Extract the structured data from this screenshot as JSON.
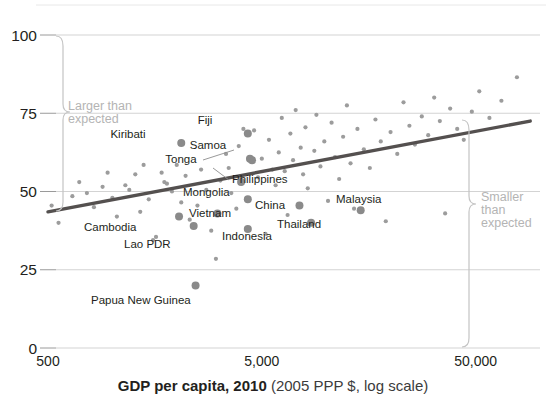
{
  "chart_data": {
    "type": "scatter",
    "title": "",
    "xlabel_bold": "GDP per capita, 2010",
    "xlabel_light": " (2005 PPP $, log scale)",
    "ylabel": "",
    "xscale": "log",
    "xlim": [
      500,
      100000
    ],
    "ylim": [
      0,
      100
    ],
    "grid": true,
    "legend": "none",
    "xticks": [
      {
        "value": 500,
        "label": "500"
      },
      {
        "value": 5000,
        "label": "5,000"
      },
      {
        "value": 50000,
        "label": "50,000"
      }
    ],
    "yticks": [
      {
        "value": 0,
        "label": "0"
      },
      {
        "value": 25,
        "label": "25"
      },
      {
        "value": 50,
        "label": "50"
      },
      {
        "value": 75,
        "label": "75"
      },
      {
        "value": 100,
        "label": "100"
      }
    ],
    "trendline": {
      "x": [
        500,
        90000
      ],
      "y": [
        43.5,
        72.5
      ],
      "color": "#54504f"
    },
    "annotations": [
      {
        "id": "larger-than-expected",
        "text_line1": "Larger than",
        "text_line2": "expected",
        "color": "#b4b4b4"
      },
      {
        "id": "smaller-than-expected",
        "text_line1": "Smaller",
        "text_line2": "than",
        "text_line3": "expected",
        "color": "#b4b4b4"
      }
    ],
    "labeled_points": [
      {
        "name": "Fiji",
        "x": 4300,
        "y": 68.5
      },
      {
        "name": "Kiribati",
        "x": 2100,
        "y": 65.5
      },
      {
        "name": "Samoa",
        "x": 4400,
        "y": 60.5
      },
      {
        "name": "Tonga",
        "x": 4500,
        "y": 60.0
      },
      {
        "name": "Philippines",
        "x": 4000,
        "y": 53.0
      },
      {
        "name": "Mongolia",
        "x": 4300,
        "y": 47.5
      },
      {
        "name": "China",
        "x": 7500,
        "y": 45.5
      },
      {
        "name": "Malaysia",
        "x": 14500,
        "y": 44.0
      },
      {
        "name": "Vietnam",
        "x": 3100,
        "y": 43.0
      },
      {
        "name": "Thailand",
        "x": 8500,
        "y": 40.0
      },
      {
        "name": "Cambodia",
        "x": 2050,
        "y": 42.0
      },
      {
        "name": "Indonesia",
        "x": 4300,
        "y": 38.0
      },
      {
        "name": "Lao PDR",
        "x": 2400,
        "y": 39.0
      },
      {
        "name": "Papua New Guinea",
        "x": 2450,
        "y": 20.0
      }
    ],
    "unlabeled_points": [
      {
        "x": 520,
        "y": 45.5
      },
      {
        "x": 560,
        "y": 40.0
      },
      {
        "x": 650,
        "y": 48.5
      },
      {
        "x": 700,
        "y": 53.0
      },
      {
        "x": 760,
        "y": 49.5
      },
      {
        "x": 820,
        "y": 45.0
      },
      {
        "x": 900,
        "y": 51.5
      },
      {
        "x": 950,
        "y": 56.0
      },
      {
        "x": 1000,
        "y": 48.0
      },
      {
        "x": 1050,
        "y": 42.0
      },
      {
        "x": 1150,
        "y": 52.0
      },
      {
        "x": 1200,
        "y": 50.5
      },
      {
        "x": 1280,
        "y": 55.5
      },
      {
        "x": 1350,
        "y": 43.5
      },
      {
        "x": 1400,
        "y": 58.5
      },
      {
        "x": 1480,
        "y": 47.5
      },
      {
        "x": 1550,
        "y": 34.5
      },
      {
        "x": 1600,
        "y": 35.5
      },
      {
        "x": 1700,
        "y": 56.0
      },
      {
        "x": 1750,
        "y": 53.0
      },
      {
        "x": 1800,
        "y": 52.5
      },
      {
        "x": 1900,
        "y": 50.0
      },
      {
        "x": 2000,
        "y": 58.5
      },
      {
        "x": 2100,
        "y": 46.5
      },
      {
        "x": 2200,
        "y": 55.0
      },
      {
        "x": 2300,
        "y": 41.0
      },
      {
        "x": 2500,
        "y": 45.5
      },
      {
        "x": 2600,
        "y": 57.0
      },
      {
        "x": 2750,
        "y": 50.5
      },
      {
        "x": 2900,
        "y": 37.5
      },
      {
        "x": 3050,
        "y": 28.5
      },
      {
        "x": 3200,
        "y": 53.5
      },
      {
        "x": 3400,
        "y": 62.0
      },
      {
        "x": 3500,
        "y": 57.5
      },
      {
        "x": 3600,
        "y": 49.5
      },
      {
        "x": 3800,
        "y": 44.5
      },
      {
        "x": 3900,
        "y": 64.5
      },
      {
        "x": 4100,
        "y": 70.0
      },
      {
        "x": 4600,
        "y": 69.5
      },
      {
        "x": 4800,
        "y": 54.5
      },
      {
        "x": 5000,
        "y": 60.5
      },
      {
        "x": 5200,
        "y": 36.5
      },
      {
        "x": 5400,
        "y": 66.5
      },
      {
        "x": 5600,
        "y": 57.0
      },
      {
        "x": 5800,
        "y": 52.0
      },
      {
        "x": 6000,
        "y": 62.5
      },
      {
        "x": 6200,
        "y": 73.5
      },
      {
        "x": 6400,
        "y": 56.5
      },
      {
        "x": 6600,
        "y": 42.5
      },
      {
        "x": 6800,
        "y": 68.5
      },
      {
        "x": 7000,
        "y": 60.0
      },
      {
        "x": 7200,
        "y": 76.0
      },
      {
        "x": 7600,
        "y": 64.0
      },
      {
        "x": 7800,
        "y": 55.5
      },
      {
        "x": 8000,
        "y": 70.5
      },
      {
        "x": 8200,
        "y": 51.0
      },
      {
        "x": 8800,
        "y": 63.0
      },
      {
        "x": 9000,
        "y": 74.5
      },
      {
        "x": 9400,
        "y": 58.0
      },
      {
        "x": 9800,
        "y": 66.0
      },
      {
        "x": 10200,
        "y": 47.0
      },
      {
        "x": 10600,
        "y": 72.0
      },
      {
        "x": 11000,
        "y": 61.0
      },
      {
        "x": 11500,
        "y": 54.0
      },
      {
        "x": 12000,
        "y": 67.5
      },
      {
        "x": 12500,
        "y": 77.5
      },
      {
        "x": 13000,
        "y": 59.0
      },
      {
        "x": 13500,
        "y": 44.5
      },
      {
        "x": 14000,
        "y": 70.0
      },
      {
        "x": 15000,
        "y": 63.5
      },
      {
        "x": 16000,
        "y": 57.5
      },
      {
        "x": 17000,
        "y": 73.0
      },
      {
        "x": 18000,
        "y": 66.0
      },
      {
        "x": 19000,
        "y": 40.5
      },
      {
        "x": 20000,
        "y": 69.0
      },
      {
        "x": 21500,
        "y": 62.0
      },
      {
        "x": 23000,
        "y": 78.5
      },
      {
        "x": 24500,
        "y": 71.0
      },
      {
        "x": 26000,
        "y": 65.0
      },
      {
        "x": 28000,
        "y": 74.0
      },
      {
        "x": 30000,
        "y": 68.0
      },
      {
        "x": 32000,
        "y": 80.0
      },
      {
        "x": 34000,
        "y": 72.5
      },
      {
        "x": 36000,
        "y": 43.0
      },
      {
        "x": 38000,
        "y": 76.5
      },
      {
        "x": 41000,
        "y": 70.0
      },
      {
        "x": 44000,
        "y": 66.5
      },
      {
        "x": 48000,
        "y": 75.5
      },
      {
        "x": 52000,
        "y": 82.0
      },
      {
        "x": 58000,
        "y": 73.5
      },
      {
        "x": 66000,
        "y": 79.0
      },
      {
        "x": 78000,
        "y": 86.5
      }
    ]
  }
}
